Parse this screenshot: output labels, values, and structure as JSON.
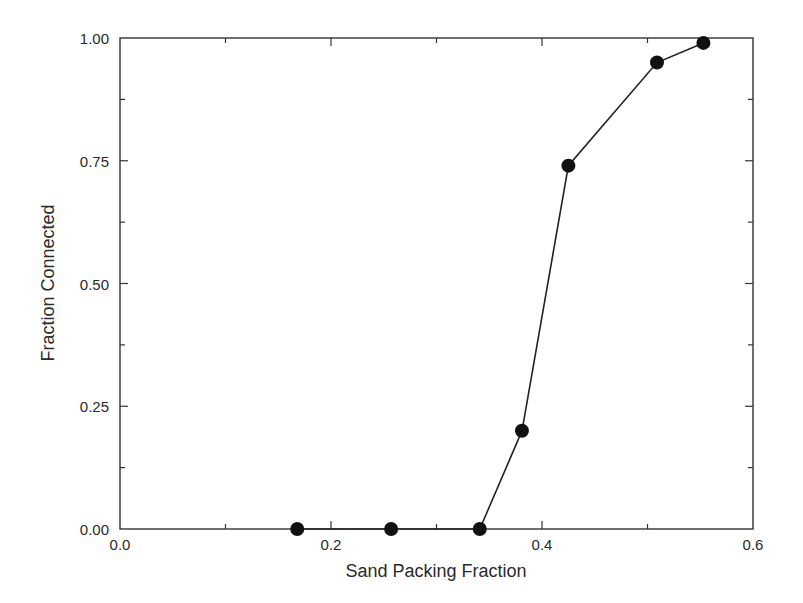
{
  "chart_data": {
    "type": "line",
    "title": "",
    "xlabel": "Sand Packing Fraction",
    "ylabel": "Fraction Connected",
    "xlim": [
      0.0,
      0.6
    ],
    "ylim": [
      0.0,
      1.0
    ],
    "x_ticks": [
      0.0,
      0.2,
      0.4,
      0.6
    ],
    "x_tick_labels": [
      "0.0",
      "0.2",
      "0.4",
      "0.6"
    ],
    "x_minor_ticks": [
      0.1,
      0.3,
      0.5
    ],
    "y_ticks": [
      0.0,
      0.25,
      0.5,
      0.75,
      1.0
    ],
    "y_tick_labels": [
      "0.00",
      "0.25",
      "0.50",
      "0.75",
      "1.00"
    ],
    "y_minor_ticks": [
      0.125,
      0.375,
      0.625,
      0.875
    ],
    "grid": false,
    "legend": null,
    "series": [
      {
        "name": "Fraction Connected",
        "marker": "filled-circle",
        "color": "#111111",
        "x": [
          0.168,
          0.257,
          0.341,
          0.381,
          0.425,
          0.509,
          0.553
        ],
        "y": [
          0.0,
          0.0,
          0.0,
          0.2,
          0.74,
          0.95,
          0.99
        ]
      }
    ]
  },
  "colors": {
    "axis": "#333333",
    "line": "#222222",
    "marker": "#111111",
    "text": "#2a2a2a"
  }
}
